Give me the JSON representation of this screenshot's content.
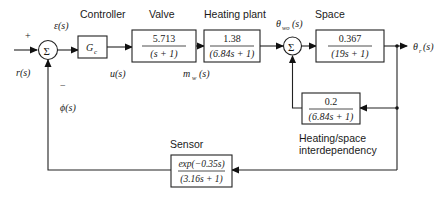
{
  "diagram": {
    "type": "block-diagram",
    "section_labels": {
      "controller": "Controller",
      "valve": "Valve",
      "heating_plant": "Heating plant",
      "space": "Space",
      "sensor": "Sensor",
      "interdependency_line1": "Heating/space",
      "interdependency_line2": "interdependency"
    },
    "signals": {
      "reference": "r(s)",
      "error": "ε(s)",
      "control": "u(s)",
      "water_flow": "m",
      "water_flow_sub": "w",
      "water_flow_arg": "(s)",
      "water_temp": "θ",
      "water_temp_sub": "wo",
      "water_temp_arg": "(s)",
      "output": "θ",
      "output_sub": "r",
      "output_arg": "(s)",
      "feedback": "ϕ(s)",
      "plus_sign": "+",
      "minus_sign": "−",
      "sum_symbol": "Σ"
    },
    "blocks": {
      "controller": {
        "label": "G",
        "sub": "c"
      },
      "valve": {
        "num": "5.713",
        "den": "(s + 1)"
      },
      "heating_plant": {
        "num": "1.38",
        "den": "(6.84s + 1)"
      },
      "space": {
        "num": "0.367",
        "den": "(19s + 1)"
      },
      "interdependency": {
        "num": "0.2",
        "den": "(6.84s + 1)"
      },
      "sensor": {
        "num": "exp(−0.35s)",
        "den": "(3.16s + 1)"
      }
    }
  }
}
